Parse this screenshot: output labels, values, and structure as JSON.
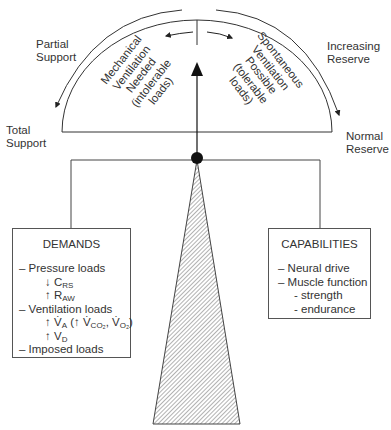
{
  "labels": {
    "partial_support": [
      "Partial",
      "Support"
    ],
    "total_support": [
      "Total",
      "Support"
    ],
    "increasing_reserve": [
      "Increasing",
      "Reserve"
    ],
    "normal_reserve": [
      "Normal",
      "Reserve"
    ],
    "left_sector": [
      "Mechanical",
      "Ventilation",
      "Needed",
      "(intolerable",
      "loads)"
    ],
    "right_sector": [
      "Spontaneous",
      "Ventilation",
      "Possible",
      "(tolerable",
      "loads)"
    ]
  },
  "demands": {
    "title": "DEMANDS",
    "items": [
      {
        "text": "– Pressure loads",
        "level": 0
      },
      {
        "arrow": "↓",
        "sym": "C",
        "sub": "RS",
        "level": 1
      },
      {
        "arrow": "↑",
        "sym": "R",
        "sub": "AW",
        "level": 1
      },
      {
        "text": "– Ventilation loads",
        "level": 0
      },
      {
        "arrow": "↑",
        "sym": "V̇",
        "sub": "A",
        "extra": "(↑ V̇CO₂, V̇O₂)",
        "level": 1
      },
      {
        "arrow": "↑",
        "sym": "V",
        "sub": "D",
        "level": 1
      },
      {
        "text": "– Imposed loads",
        "level": 0
      }
    ]
  },
  "capabilities": {
    "title": "CAPABILITIES",
    "items": [
      {
        "text": "– Neural drive",
        "level": 0
      },
      {
        "text": "– Muscle function",
        "level": 0
      },
      {
        "text": "- strength",
        "level": 2
      },
      {
        "text": "- endurance",
        "level": 2
      }
    ]
  },
  "colors": {
    "line": "#333333",
    "hatch": "#555555",
    "background": "#ffffff"
  }
}
